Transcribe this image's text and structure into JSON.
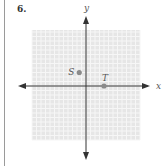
{
  "problem": {
    "number": "6."
  },
  "colors": {
    "grid_bg": "#e6e6e6",
    "grid_line": "#f6f6f6",
    "axis": "#333333",
    "point": "#8a8a8a"
  },
  "chart_data": {
    "type": "scatter",
    "title": "",
    "xlabel": "x",
    "ylabel": "y",
    "xlim": [
      -12,
      12
    ],
    "ylim": [
      -12,
      12
    ],
    "grid": true,
    "points": [
      {
        "label": "S",
        "x": -1.5,
        "y": 3
      },
      {
        "label": "T",
        "x": 4,
        "y": 0
      }
    ]
  }
}
